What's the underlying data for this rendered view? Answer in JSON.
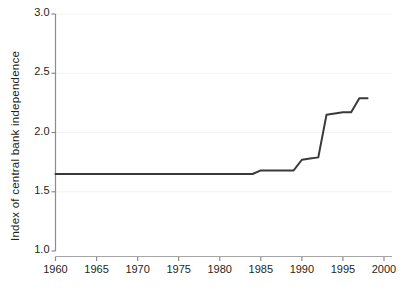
{
  "chart_data": {
    "type": "line",
    "title": "",
    "subtitle": "",
    "xlabel": "",
    "ylabel": "Index of central bank independence",
    "xlim": [
      1960,
      2000
    ],
    "ylim": [
      1.0,
      3.0
    ],
    "xticks": [
      1960,
      1965,
      1970,
      1975,
      1980,
      1985,
      1990,
      1995,
      2000
    ],
    "xtick_labels": [
      "1960",
      "1965",
      "1970",
      "1975",
      "1980",
      "1985",
      "1990",
      "1995",
      "2000"
    ],
    "yticks": [
      1.0,
      1.5,
      2.0,
      2.5,
      3.0
    ],
    "ytick_labels": [
      "1.0",
      "1.5",
      "2.0",
      "2.5",
      "3.0"
    ],
    "grid": "horizontal-faint",
    "legend": "none",
    "line_color": "#3a3a3a",
    "line_width": 2.0,
    "axis_color": "#8c8c8c",
    "text_color": "#231f20",
    "background": "#ffffff",
    "x": [
      1960,
      1961,
      1962,
      1963,
      1964,
      1965,
      1966,
      1967,
      1968,
      1969,
      1970,
      1971,
      1972,
      1973,
      1974,
      1975,
      1976,
      1977,
      1978,
      1979,
      1980,
      1981,
      1982,
      1983,
      1984,
      1985,
      1986,
      1987,
      1988,
      1989,
      1990,
      1991,
      1992,
      1993,
      1994,
      1995,
      1996,
      1997,
      1998
    ],
    "y": [
      1.65,
      1.65,
      1.65,
      1.65,
      1.65,
      1.65,
      1.65,
      1.65,
      1.65,
      1.65,
      1.65,
      1.65,
      1.65,
      1.65,
      1.65,
      1.65,
      1.65,
      1.65,
      1.65,
      1.65,
      1.65,
      1.65,
      1.65,
      1.65,
      1.65,
      1.68,
      1.68,
      1.68,
      1.68,
      1.68,
      1.77,
      1.78,
      1.79,
      2.15,
      2.16,
      2.17,
      2.17,
      2.29,
      2.29
    ],
    "series": [
      {
        "name": "Index of central bank independence",
        "values": [
          1.65,
          1.65,
          1.65,
          1.65,
          1.65,
          1.65,
          1.65,
          1.65,
          1.65,
          1.65,
          1.65,
          1.65,
          1.65,
          1.65,
          1.65,
          1.65,
          1.65,
          1.65,
          1.65,
          1.65,
          1.65,
          1.65,
          1.65,
          1.65,
          1.65,
          1.68,
          1.68,
          1.68,
          1.68,
          1.68,
          1.77,
          1.78,
          1.79,
          2.15,
          2.16,
          2.17,
          2.17,
          2.29,
          2.29
        ]
      }
    ],
    "annotations": []
  }
}
